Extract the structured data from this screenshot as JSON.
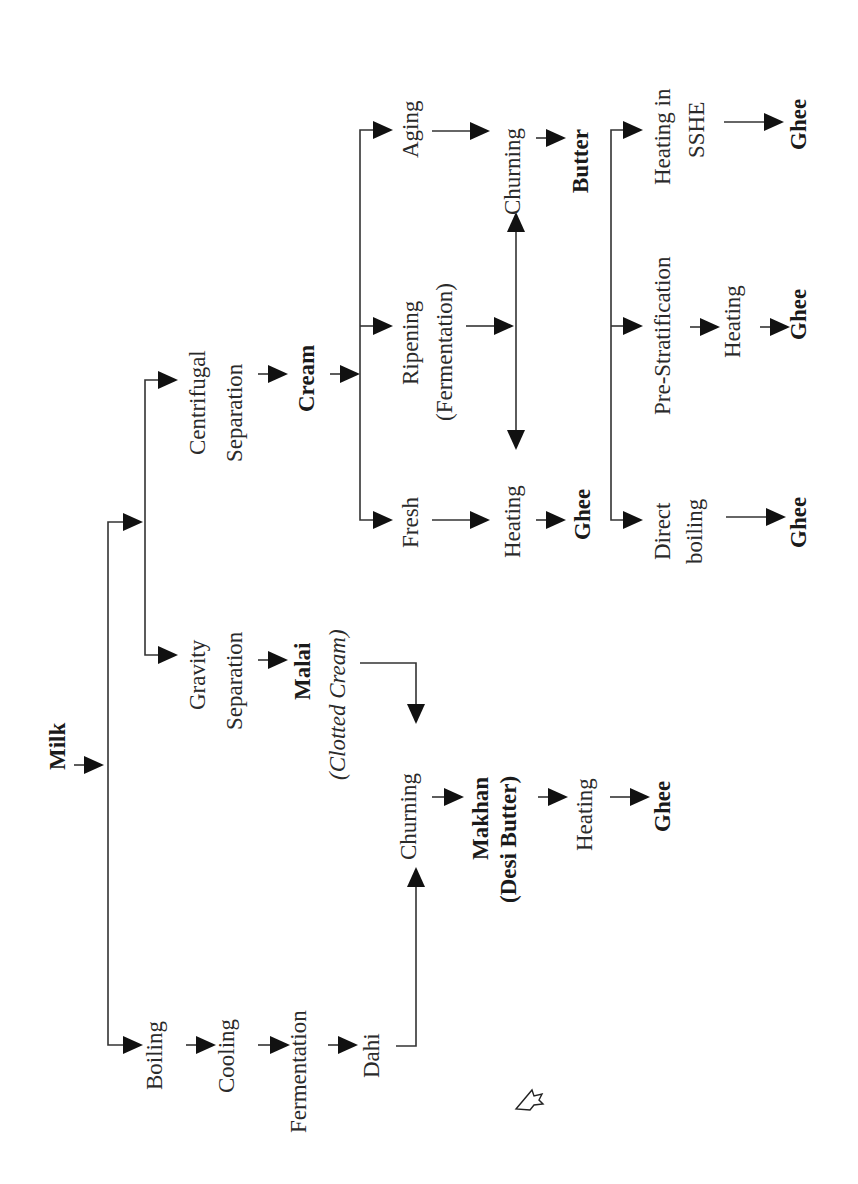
{
  "diagram": {
    "orientation": "rotated-90-ccw",
    "root": "Milk",
    "branches": {
      "desi_method": {
        "steps": [
          "Boiling",
          "Cooling",
          "Fermentation",
          "Dahi"
        ],
        "joins": "Churning"
      },
      "separation": {
        "gravity": {
          "step": "Gravity Separation",
          "line1": "Gravity",
          "line2": "Separation",
          "product": "Malai",
          "product_note": "(Clotted Cream)",
          "joins": "Churning"
        },
        "centrifugal": {
          "line1": "Centrifugal",
          "line2": "Separation",
          "product": "Cream"
        }
      },
      "makhan_path": {
        "churning": "Churning",
        "product_line1": "Makhan",
        "product_line2": "(Desi Butter)",
        "heating": "Heating",
        "end": "Ghee"
      },
      "cream_options": {
        "fresh": {
          "label": "Fresh",
          "heating": "Heating",
          "end": "Ghee"
        },
        "ripening": {
          "line1": "Ripening",
          "line2": "(Fermentation)"
        },
        "aging": {
          "label": "Aging"
        },
        "churning": "Churning",
        "butter": "Butter"
      },
      "butter_methods": {
        "direct": {
          "line1": "Direct",
          "line2": "boiling",
          "end": "Ghee"
        },
        "prestrat": {
          "label": "Pre-Stratification",
          "heating": "Heating",
          "end": "Ghee"
        },
        "sshe": {
          "line1": "Heating in",
          "line2": "SSHE",
          "end": "Ghee"
        }
      }
    }
  },
  "overlay": {
    "cursor_icon": "mouse-pointer-icon"
  }
}
